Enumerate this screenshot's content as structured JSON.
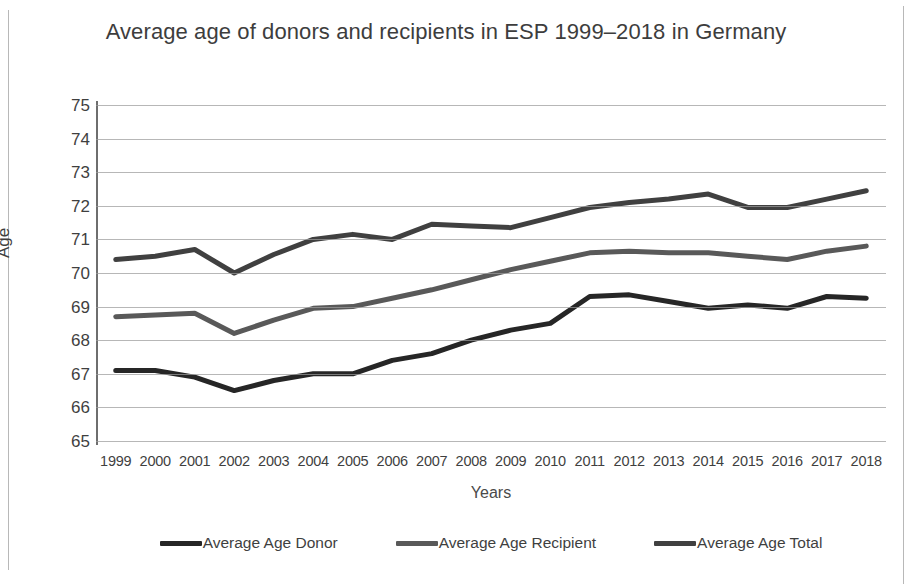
{
  "chart_data": {
    "type": "line",
    "title": "Average age of donors and recipients in ESP 1999–2018 in Germany",
    "xlabel": "Years",
    "ylabel": "Age",
    "ylim": [
      65,
      75
    ],
    "ytick_labels": [
      "75",
      "74",
      "73",
      "72",
      "71",
      "70",
      "69",
      "68",
      "67",
      "66",
      "65"
    ],
    "grid": true,
    "legend_position": "bottom",
    "categories": [
      "1999",
      "2000",
      "2001",
      "2002",
      "2003",
      "2004",
      "2005",
      "2006",
      "2007",
      "2008",
      "2009",
      "2010",
      "2011",
      "2012",
      "2013",
      "2014",
      "2015",
      "2016",
      "2017",
      "2018"
    ],
    "series": [
      {
        "name": "Average Age Donor",
        "color": "#262626",
        "values": [
          67.1,
          67.1,
          66.9,
          66.5,
          66.8,
          67.0,
          67.0,
          67.4,
          67.6,
          68.0,
          68.3,
          68.5,
          69.3,
          69.35,
          69.15,
          68.95,
          69.05,
          68.95,
          69.3,
          69.25
        ]
      },
      {
        "name": "Average Age Recipient",
        "color": "#595959",
        "values": [
          68.7,
          68.75,
          68.8,
          68.2,
          68.6,
          68.95,
          69.0,
          69.25,
          69.5,
          69.8,
          70.1,
          70.35,
          70.6,
          70.65,
          70.6,
          70.6,
          70.5,
          70.4,
          70.65,
          70.8
        ]
      },
      {
        "name": "Average Age Total",
        "color": "#404040",
        "values": [
          70.4,
          70.5,
          70.7,
          70.0,
          70.55,
          71.0,
          71.15,
          71.0,
          71.45,
          71.4,
          71.35,
          71.65,
          71.95,
          72.1,
          72.2,
          72.35,
          71.95,
          71.95,
          72.2,
          72.45
        ]
      }
    ]
  }
}
